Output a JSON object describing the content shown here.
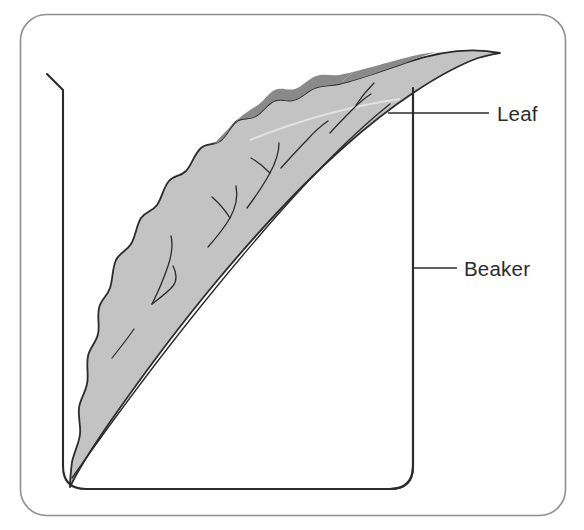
{
  "figure": {
    "kind": "labeled-diagram",
    "background_color": "#ffffff"
  },
  "frame": {
    "name": "figure-border",
    "stroke_color": "#8f8f8f"
  },
  "beaker": {
    "name": "beaker",
    "stroke_color": "#2b2b2b",
    "fill_color": "none",
    "has_pouring_lip": true
  },
  "leaf": {
    "name": "leaf",
    "blade_fill": "#c3c3c3",
    "shadow_fill": "#8a8a8a",
    "outline_color": "#2b2b2b",
    "vein_color": "#2b2b2b",
    "highlight_color": "#e8e8e8"
  },
  "labels": [
    {
      "id": "leaf",
      "text": "Leaf",
      "text_x": 497,
      "text_y": 121,
      "leader_x1": 388,
      "leader_x2": 489,
      "leader_y": 113,
      "color": "#2b2b2b"
    },
    {
      "id": "beaker",
      "text": "Beaker",
      "text_x": 464,
      "text_y": 276,
      "leader_x1": 413,
      "leader_x2": 457,
      "leader_y": 268,
      "color": "#2b2b2b"
    }
  ]
}
